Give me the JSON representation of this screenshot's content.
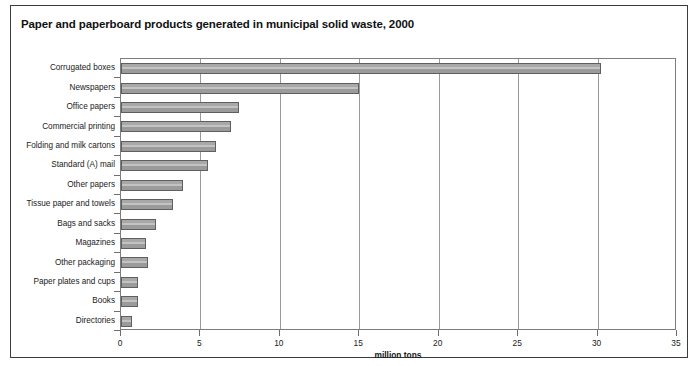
{
  "chart_data": {
    "type": "bar",
    "orientation": "horizontal",
    "title": "Paper and paperboard products generated in municipal solid waste, 2000",
    "xlabel": "million tons",
    "ylabel": "",
    "xlim": [
      0,
      35
    ],
    "xticks": [
      0,
      5,
      10,
      15,
      20,
      25,
      30,
      35
    ],
    "grid": true,
    "grid_axis": "x",
    "legend": null,
    "categories": [
      "Corrugated boxes",
      "Newspapers",
      "Office papers",
      "Commercial printing",
      "Folding and milk cartons",
      "Standard (A) mail",
      "Other papers",
      "Tissue paper and towels",
      "Bags and sacks",
      "Magazines",
      "Other packaging",
      "Paper plates and cups",
      "Books",
      "Directories"
    ],
    "values": [
      30.2,
      15.0,
      7.4,
      6.9,
      6.0,
      5.5,
      3.9,
      3.3,
      2.2,
      1.6,
      1.7,
      1.1,
      1.1,
      0.7
    ],
    "bar_color": "#9d9d9d",
    "bar_edge_color": "#5f5f5f",
    "frame_color": "#3c3c3c"
  },
  "figure": {
    "title": "Paper and paperboard products generated in municipal solid waste, 2000",
    "axis_title": "million tons"
  }
}
